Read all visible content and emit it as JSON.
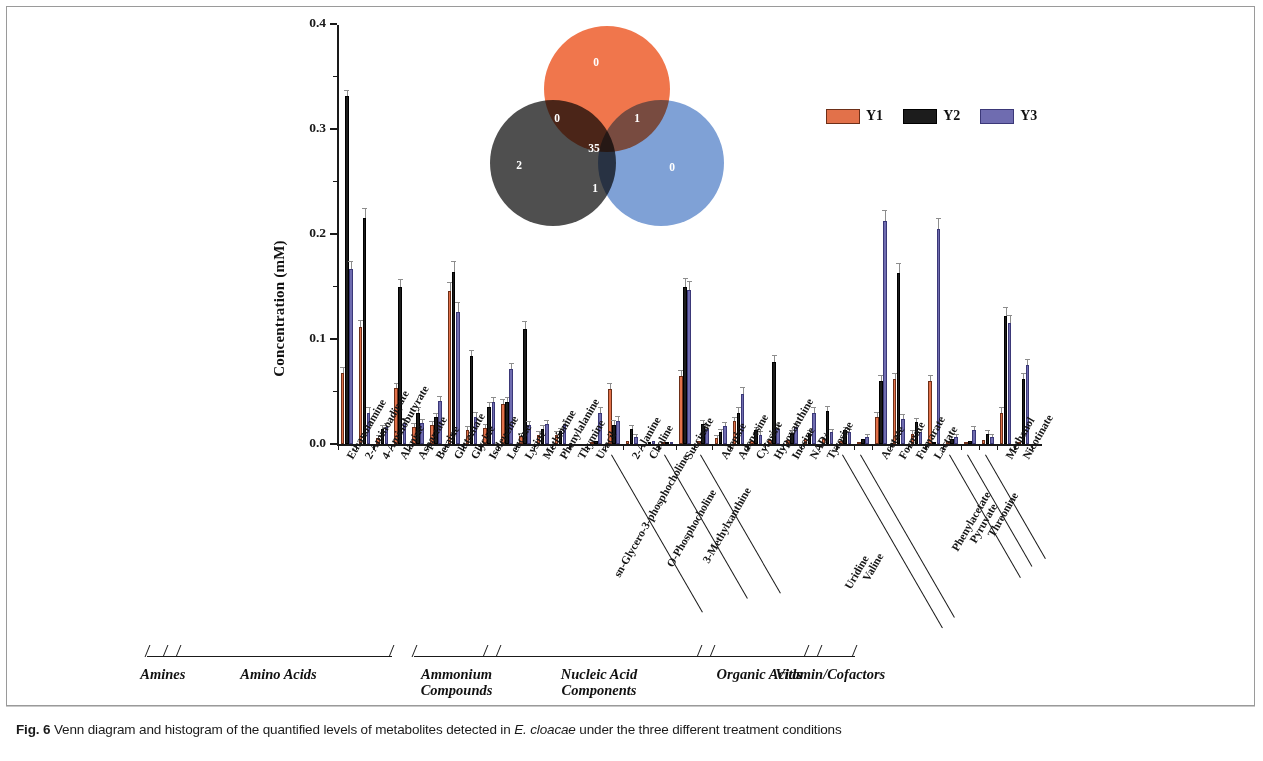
{
  "figure": {
    "caption_prefix": "Fig. 6",
    "caption_part1": " Venn diagram and histogram of the quantified levels of metabolites detected in ",
    "caption_italic": "E. cloacae",
    "caption_part2": " under the three different treatment conditions"
  },
  "legend": {
    "position": "top-right",
    "items": [
      {
        "label": "Y1",
        "color": "#e2714a"
      },
      {
        "label": "Y2",
        "color": "#1c1c1c"
      },
      {
        "label": "Y3",
        "color": "#6f6cb0"
      }
    ]
  },
  "venn": {
    "circles": [
      {
        "name": "Y1",
        "color": "#f0764c",
        "position": "top"
      },
      {
        "name": "Y2",
        "color": "#4f4f4f",
        "position": "left"
      },
      {
        "name": "Y3",
        "color": "#7fa1d6",
        "position": "right"
      }
    ],
    "regions": [
      {
        "id": "only-top",
        "value": "0",
        "x": 109,
        "y": 30
      },
      {
        "id": "top-left",
        "value": "0",
        "x": 70,
        "y": 86
      },
      {
        "id": "top-right",
        "value": "1",
        "x": 150,
        "y": 86
      },
      {
        "id": "center",
        "value": "35",
        "x": 107,
        "y": 116
      },
      {
        "id": "only-left",
        "value": "2",
        "x": 32,
        "y": 133
      },
      {
        "id": "left-right",
        "value": "1",
        "x": 108,
        "y": 156
      },
      {
        "id": "only-right",
        "value": "0",
        "x": 185,
        "y": 135
      }
    ]
  },
  "categories_groups": [
    {
      "label": "Amines",
      "label_line2": "",
      "start": 0,
      "end": 0
    },
    {
      "label": "Amino Acids",
      "label_line2": "",
      "start": 1,
      "end": 12
    },
    {
      "label": "Ammonium",
      "label_line2": "Compounds",
      "start": 15,
      "end": 18
    },
    {
      "label": "Nucleic Acid",
      "label_line2": "Components",
      "start": 19,
      "end": 30
    },
    {
      "label": "Organic Acids",
      "label_line2": "",
      "start": 31,
      "end": 36
    },
    {
      "label": "Vitamin/Cofactors",
      "label_line2": "",
      "start": 37,
      "end": 38
    }
  ],
  "chart_data": {
    "type": "bar",
    "title": "",
    "xlabel": "",
    "ylabel": "Concentration (mM)",
    "ylim": [
      0.0,
      0.4
    ],
    "yticks": [
      "0.0",
      "0.1",
      "0.2",
      "0.3",
      "0.4"
    ],
    "ytick_values": [
      0.0,
      0.1,
      0.2,
      0.3,
      0.4
    ],
    "minor_tick_step": 0.05,
    "grid": false,
    "legend_position": "upper right",
    "categories": [
      "Ethanolamine",
      "2-Aminoadipate",
      "4-Aminobutyrate",
      "Alanine",
      "Aspartate",
      "Betaine",
      "Glutamate",
      "Glycine",
      "Isoleucine",
      "Leucine",
      "Lysine",
      "Methionine",
      "Phenylalanine",
      "Thymine",
      "Uracil",
      "sn-Glycero-3-phosphocholine",
      "2-Alanine",
      "Choline",
      "O-Phosphocholine",
      "Succinate",
      "3-Methylxanthine",
      "Adenine",
      "Adenosine",
      "Cytosine",
      "Hypoxanthine",
      "Inosine",
      "NAD+",
      "Tyrosine",
      "Uridine",
      "Valine",
      "Acetate",
      "Formate",
      "Fumarate",
      "Lactate",
      "Phenylacetate",
      "Pyruvate",
      "Threonine",
      "Methanol",
      "Nicotinate"
    ],
    "series": [
      {
        "name": "Y1",
        "color": "#e2714a",
        "values": [
          0.068,
          0.111,
          0.006,
          0.053,
          0.016,
          0.018,
          0.146,
          0.013,
          0.015,
          0.038,
          0.008,
          0.009,
          0.009,
          0.0,
          0.002,
          0.052,
          0.003,
          0.0,
          0.001,
          0.065,
          0.003,
          0.006,
          0.022,
          0.003,
          0.004,
          0.004,
          0.005,
          0.005,
          0.003,
          0.002,
          0.026,
          0.062,
          0.01,
          0.06,
          0.003,
          0.002,
          0.004,
          0.03,
          0.002
        ],
        "errors": [
          0.004,
          0.006,
          0.002,
          0.004,
          0.003,
          0.003,
          0.007,
          0.003,
          0.003,
          0.004,
          0.002,
          0.002,
          0.002,
          0.0,
          0.001,
          0.005,
          0.001,
          0.0,
          0.001,
          0.005,
          0.001,
          0.002,
          0.003,
          0.001,
          0.001,
          0.001,
          0.001,
          0.001,
          0.001,
          0.001,
          0.004,
          0.005,
          0.002,
          0.005,
          0.001,
          0.001,
          0.001,
          0.004,
          0.001
        ]
      },
      {
        "name": "Y2",
        "color": "#1c1c1c",
        "values": [
          0.331,
          0.215,
          0.014,
          0.15,
          0.03,
          0.026,
          0.164,
          0.084,
          0.035,
          0.04,
          0.11,
          0.014,
          0.012,
          0.0,
          0.003,
          0.018,
          0.014,
          0.002,
          0.001,
          0.15,
          0.019,
          0.011,
          0.03,
          0.013,
          0.078,
          0.01,
          0.01,
          0.031,
          0.013,
          0.005,
          0.06,
          0.163,
          0.021,
          0.001,
          0.005,
          0.003,
          0.01,
          0.122,
          0.062
        ],
        "errors": [
          0.005,
          0.009,
          0.003,
          0.006,
          0.004,
          0.003,
          0.009,
          0.005,
          0.004,
          0.004,
          0.006,
          0.003,
          0.002,
          0.0,
          0.001,
          0.004,
          0.003,
          0.001,
          0.001,
          0.007,
          0.003,
          0.002,
          0.004,
          0.002,
          0.006,
          0.002,
          0.002,
          0.004,
          0.002,
          0.001,
          0.005,
          0.008,
          0.003,
          0.001,
          0.001,
          0.001,
          0.002,
          0.008,
          0.005
        ]
      },
      {
        "name": "Y3",
        "color": "#6f6cb0",
        "values": [
          0.167,
          0.03,
          0.016,
          0.02,
          0.02,
          0.041,
          0.126,
          0.026,
          0.04,
          0.071,
          0.018,
          0.019,
          0.018,
          0.0,
          0.03,
          0.022,
          0.007,
          0.003,
          0.002,
          0.147,
          0.014,
          0.017,
          0.048,
          0.009,
          0.014,
          0.016,
          0.03,
          0.011,
          0.011,
          0.007,
          0.212,
          0.024,
          0.011,
          0.205,
          0.007,
          0.013,
          0.007,
          0.115,
          0.075
        ],
        "errors": [
          0.006,
          0.004,
          0.003,
          0.004,
          0.003,
          0.004,
          0.008,
          0.004,
          0.004,
          0.005,
          0.003,
          0.003,
          0.003,
          0.0,
          0.004,
          0.004,
          0.002,
          0.001,
          0.001,
          0.007,
          0.003,
          0.003,
          0.005,
          0.002,
          0.003,
          0.003,
          0.004,
          0.002,
          0.002,
          0.002,
          0.01,
          0.004,
          0.002,
          0.009,
          0.002,
          0.003,
          0.002,
          0.007,
          0.005
        ]
      }
    ]
  }
}
